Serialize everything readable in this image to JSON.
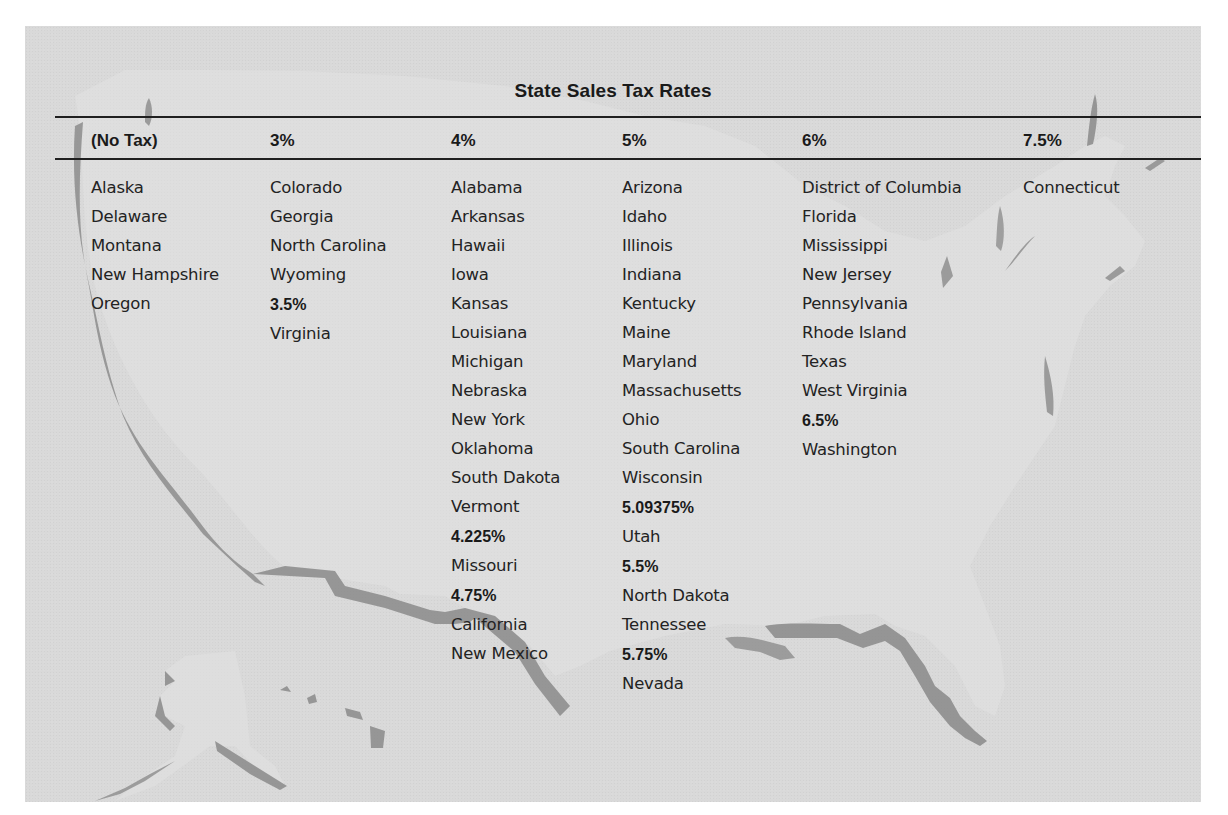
{
  "title": "State Sales Tax Rates",
  "columns": [
    {
      "header": "(No Tax)",
      "groups": [
        {
          "rate": null,
          "states": [
            "Alaska",
            "Delaware",
            "Montana",
            "New Hampshire",
            "Oregon"
          ]
        }
      ]
    },
    {
      "header": "3%",
      "groups": [
        {
          "rate": null,
          "states": [
            "Colorado",
            "Georgia",
            "North Carolina",
            "Wyoming"
          ]
        },
        {
          "rate": "3.5%",
          "states": [
            "Virginia"
          ]
        }
      ]
    },
    {
      "header": "4%",
      "groups": [
        {
          "rate": null,
          "states": [
            "Alabama",
            "Arkansas",
            "Hawaii",
            "Iowa",
            "Kansas",
            "Louisiana",
            "Michigan",
            "Nebraska",
            "New York",
            "Oklahoma",
            "South Dakota",
            "Vermont"
          ]
        },
        {
          "rate": "4.225%",
          "states": [
            "Missouri"
          ]
        },
        {
          "rate": "4.75%",
          "states": [
            "California",
            "New Mexico"
          ]
        }
      ]
    },
    {
      "header": "5%",
      "groups": [
        {
          "rate": null,
          "states": [
            "Arizona",
            "Idaho",
            "Illinois",
            "Indiana",
            "Kentucky",
            "Maine",
            "Maryland",
            "Massachusetts",
            "Ohio",
            "South Carolina",
            "Wisconsin"
          ]
        },
        {
          "rate": "5.09375%",
          "states": [
            "Utah"
          ]
        },
        {
          "rate": "5.5%",
          "states": [
            "North Dakota",
            "Tennessee"
          ]
        },
        {
          "rate": "5.75%",
          "states": [
            "Nevada"
          ]
        }
      ]
    },
    {
      "header": "6%",
      "groups": [
        {
          "rate": null,
          "states": [
            "District of Columbia",
            "Florida",
            "Mississippi",
            "New Jersey",
            "Pennsylvania",
            "Rhode Island",
            "Texas",
            "West Virginia"
          ]
        },
        {
          "rate": "6.5%",
          "states": [
            "Washington"
          ]
        }
      ]
    },
    {
      "header": "7.5%",
      "groups": [
        {
          "rate": null,
          "states": [
            "Connecticut"
          ]
        }
      ]
    }
  ],
  "background": {
    "image": "us-map-silhouette",
    "panel_color": "#d9d9d9",
    "map_fill": "#dcdcdc",
    "map_shadow": "#8c8c8c"
  }
}
